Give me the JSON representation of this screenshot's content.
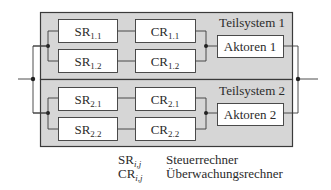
{
  "diagram": {
    "subsystems": [
      {
        "title": "Teilsystem 1",
        "controllers": [
          {
            "sr": {
              "base": "SR",
              "sub": "1.1"
            },
            "cr": {
              "base": "CR",
              "sub": "1.1"
            }
          },
          {
            "sr": {
              "base": "SR",
              "sub": "1.2"
            },
            "cr": {
              "base": "CR",
              "sub": "1.2"
            }
          }
        ],
        "actuator": "Aktoren 1"
      },
      {
        "title": "Teilsystem 2",
        "controllers": [
          {
            "sr": {
              "base": "SR",
              "sub": "2.1"
            },
            "cr": {
              "base": "CR",
              "sub": "2.1"
            }
          },
          {
            "sr": {
              "base": "SR",
              "sub": "2.2"
            },
            "cr": {
              "base": "CR",
              "sub": "2.2"
            }
          }
        ],
        "actuator": "Aktoren 2"
      }
    ],
    "legend": [
      {
        "symbol": "SR",
        "sub": "i,j",
        "description": "Steuerrechner"
      },
      {
        "symbol": "CR",
        "sub": "i,j",
        "description": "Überwachungsrechner"
      }
    ],
    "colors": {
      "panel_fill": "#d6d6d6",
      "box_fill": "#ffffff",
      "stroke": "#3a3a3a",
      "text": "#2b2b2b"
    }
  }
}
